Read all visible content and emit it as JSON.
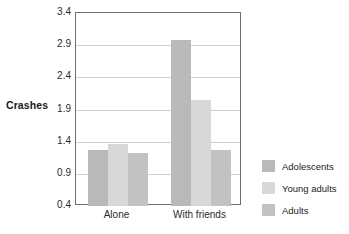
{
  "chart_data": {
    "type": "bar",
    "title": "",
    "xlabel": "",
    "ylabel": "Crashes",
    "categories": [
      "Alone",
      "With friends"
    ],
    "series": [
      {
        "name": "Adolescents",
        "values": [
          1.27,
          2.98
        ],
        "color": "#b9b9b9"
      },
      {
        "name": "Young adults",
        "values": [
          1.36,
          2.05
        ],
        "color": "#d8d8d8"
      },
      {
        "name": "Adults",
        "values": [
          1.22,
          1.27
        ],
        "color": "#c2c2c2"
      }
    ],
    "ylim": [
      0.4,
      3.4
    ],
    "yticks": [
      "0.4",
      "0.9",
      "1.4",
      "1.9",
      "2.4",
      "2.9",
      "3.4"
    ],
    "ytick_values": [
      0.4,
      0.9,
      1.4,
      1.9,
      2.4,
      2.9,
      3.4
    ],
    "grid": true,
    "legend_position": "right"
  },
  "axes": {
    "y_title": "Crashes",
    "y_ticks": [
      {
        "label": "3.4"
      },
      {
        "label": "2.9"
      },
      {
        "label": "2.4"
      },
      {
        "label": "1.9"
      },
      {
        "label": "1.4"
      },
      {
        "label": "0.9"
      },
      {
        "label": "0.4"
      }
    ],
    "x_ticks": [
      {
        "label": "Alone"
      },
      {
        "label": "With friends"
      }
    ]
  },
  "legend": {
    "items": [
      {
        "label": "Adolescents",
        "color": "#b9b9b9"
      },
      {
        "label": "Young adults",
        "color": "#d8d8d8"
      },
      {
        "label": "Adults",
        "color": "#c2c2c2"
      }
    ]
  },
  "colors": {
    "frame": "#6f6f6f",
    "gridline": "#cfcfcf",
    "background": "#ffffff",
    "text": "#1b1b1b"
  }
}
